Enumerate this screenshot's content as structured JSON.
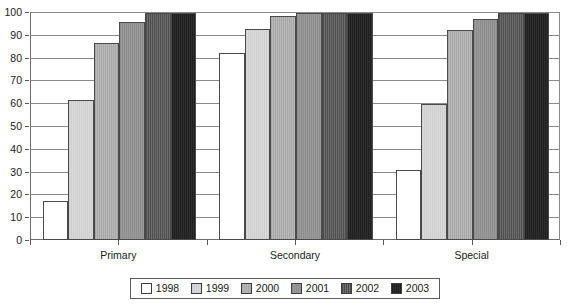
{
  "chart_data": {
    "type": "bar",
    "title": "",
    "subtitle": "",
    "xlabel": "",
    "ylabel": "",
    "categories": [
      "Primary",
      "Secondary",
      "Special"
    ],
    "series": [
      {
        "name": "1998",
        "color": "#ffffff",
        "values": [
          17.5,
          82.5,
          31
        ]
      },
      {
        "name": "1999",
        "color": "#d4d4d4",
        "values": [
          62,
          93,
          60
        ]
      },
      {
        "name": "2000",
        "color": "#b0b0b0",
        "values": [
          87,
          98.5,
          92.5
        ]
      },
      {
        "name": "2001",
        "color": "#939393",
        "values": [
          96,
          100,
          97.5
        ]
      },
      {
        "name": "2002",
        "color": "#5e5e5e",
        "values": [
          100,
          100,
          100
        ]
      },
      {
        "name": "2003",
        "color": "#262626",
        "values": [
          100,
          100,
          100
        ]
      }
    ],
    "ylim": [
      0,
      100
    ],
    "yticks": [
      0,
      10,
      20,
      30,
      40,
      50,
      60,
      70,
      80,
      90,
      100
    ],
    "ytick_labels": [
      "0",
      "10",
      "20",
      "30",
      "40",
      "50",
      "60",
      "70",
      "80",
      "90",
      "100"
    ],
    "grid": true,
    "grid_axis": "y",
    "legend_position": "bottom"
  }
}
